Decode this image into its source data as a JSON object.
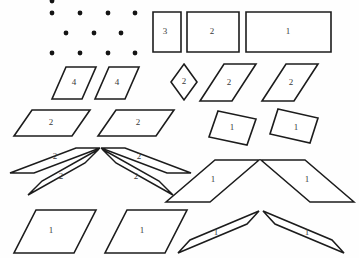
{
  "figure": {
    "background_color": "#fefefe",
    "stroke_color": "#1c1c1c",
    "label_color": "#3a3a3a",
    "dot_color": "#141414",
    "width": 359,
    "height": 258
  },
  "dot_grid": {
    "name": "isometric-dot-grid",
    "dot_radius": 2.4,
    "dots": [
      {
        "x": 52,
        "y": 1
      },
      {
        "x": 52,
        "y": 13
      },
      {
        "x": 80,
        "y": 13
      },
      {
        "x": 108,
        "y": 13
      },
      {
        "x": 135,
        "y": 13
      },
      {
        "x": 66,
        "y": 33
      },
      {
        "x": 94,
        "y": 33
      },
      {
        "x": 121,
        "y": 33
      },
      {
        "x": 52,
        "y": 53
      },
      {
        "x": 80,
        "y": 53
      },
      {
        "x": 108,
        "y": 53
      },
      {
        "x": 135,
        "y": 53
      }
    ]
  },
  "shapes": [
    {
      "id": "rect-3",
      "kind": "rectangle",
      "label": "3",
      "label_x": 165,
      "label_y": 32,
      "points": "153,12 181,12 181,52 153,52"
    },
    {
      "id": "rect-2",
      "kind": "rectangle",
      "label": "2",
      "label_x": 212,
      "label_y": 32,
      "points": "187,12 239,12 239,52 187,52"
    },
    {
      "id": "rect-1",
      "kind": "rectangle",
      "label": "1",
      "label_x": 288,
      "label_y": 32,
      "points": "246,12 331,12 331,52 246,52"
    },
    {
      "id": "para-4-left",
      "kind": "parallelogram",
      "label": "4",
      "label_x": 74,
      "label_y": 83,
      "points": "66,67 96,67 82,99 52,99"
    },
    {
      "id": "para-4-right",
      "kind": "parallelogram",
      "label": "4",
      "label_x": 117,
      "label_y": 83,
      "points": "109,67 139,67 125,99 95,99"
    },
    {
      "id": "rhombus-2",
      "kind": "rhombus",
      "label": "2",
      "label_x": 184,
      "label_y": 82,
      "points": "184,64 197,82 184,100 171,82"
    },
    {
      "id": "para-2-steep-left",
      "kind": "parallelogram",
      "label": "2",
      "label_x": 229,
      "label_y": 83,
      "points": "224,64 256,64 232,101 200,101"
    },
    {
      "id": "para-2-steep-right",
      "kind": "parallelogram",
      "label": "2",
      "label_x": 291,
      "label_y": 83,
      "points": "286,64 318,64 294,101 262,101"
    },
    {
      "id": "para-2-wide-left",
      "kind": "parallelogram",
      "label": "2",
      "label_x": 51,
      "label_y": 123,
      "points": "32,110 90,110 72,136 14,136"
    },
    {
      "id": "para-2-wide-right",
      "kind": "parallelogram",
      "label": "2",
      "label_x": 138,
      "label_y": 123,
      "points": "116,110 174,110 156,136 98,136"
    },
    {
      "id": "quad-1-tilt-left",
      "kind": "tilted-rectangle",
      "label": "1",
      "label_x": 232,
      "label_y": 128,
      "points": "218,111 256,119 247,145 209,137"
    },
    {
      "id": "quad-1-tilt-right",
      "kind": "tilted-rectangle",
      "label": "1",
      "label_x": 296,
      "label_y": 128,
      "points": "278,109 318,118 310,143 270,134"
    },
    {
      "id": "sliver-2-upper-left",
      "kind": "thin-parallelogram",
      "label": "2",
      "label_x": 55,
      "label_y": 157,
      "points": "100,148 76,148 10,173 34,173"
    },
    {
      "id": "sliver-2-upper-right",
      "kind": "thin-parallelogram",
      "label": "2",
      "label_x": 139,
      "label_y": 157,
      "points": "101,148 125,148 191,173 167,173"
    },
    {
      "id": "sliver-2-lower-left",
      "kind": "thin-parallelogram",
      "label": "2",
      "label_x": 61,
      "label_y": 177,
      "points": "99,149 85,163 28,195 42,181"
    },
    {
      "id": "sliver-2-lower-right",
      "kind": "thin-parallelogram",
      "label": "2",
      "label_x": 136,
      "label_y": 177,
      "points": "102,149 116,163 173,195 159,181"
    },
    {
      "id": "sliver-1-mid-left",
      "kind": "thin-parallelogram",
      "label": "1",
      "label_x": 213,
      "label_y": 180,
      "points": "259,160 215,160 166,202 210,202"
    },
    {
      "id": "sliver-1-mid-right",
      "kind": "thin-parallelogram",
      "label": "1",
      "label_x": 307,
      "label_y": 180,
      "points": "261,160 305,160 354,202 310,202"
    },
    {
      "id": "para-1-big-left",
      "kind": "parallelogram",
      "label": "1",
      "label_x": 51,
      "label_y": 231,
      "points": "36,210 96,210 74,253 14,253"
    },
    {
      "id": "para-1-big-right",
      "kind": "parallelogram",
      "label": "1",
      "label_x": 142,
      "label_y": 231,
      "points": "127,210 187,210 165,253 105,253"
    },
    {
      "id": "sliver-1-bottom-left",
      "kind": "thin-parallelogram",
      "label": "1",
      "label_x": 216,
      "label_y": 233,
      "points": "259,211 247,224 178,253 190,240"
    },
    {
      "id": "sliver-1-bottom-right",
      "kind": "thin-parallelogram",
      "label": "1",
      "label_x": 307,
      "label_y": 233,
      "points": "263,211 275,224 344,253 332,240"
    }
  ]
}
